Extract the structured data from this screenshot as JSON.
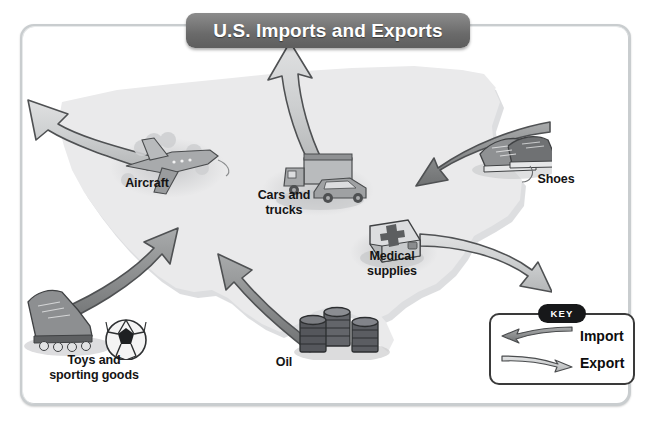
{
  "title": {
    "text": "U.S. Imports and Exports"
  },
  "map": {
    "name": "united-states-map",
    "fill": "#e9e9ea",
    "shadow": "#d6d6d8"
  },
  "colors": {
    "banner": "#6a6a6a",
    "frame_border": "#c9cdcf",
    "import_arrow_dark": "#8e9091",
    "export_arrow_light": "#c7c9ca",
    "arrow_outline": "#4a4c4e",
    "label_text": "#141414",
    "key_border": "#3a3a3a",
    "key_pill": "#17181a",
    "background": "#ffffff"
  },
  "labels": [
    {
      "id": "aircraft",
      "name": "label-aircraft",
      "lines": [
        "Aircraft"
      ],
      "x": 142,
      "y": 176
    },
    {
      "id": "cars",
      "name": "label-cars-and-trucks",
      "lines": [
        "Cars and",
        "trucks"
      ],
      "x": 248,
      "y": 188
    },
    {
      "id": "medical",
      "name": "label-medical-supplies",
      "lines": [
        "Medical",
        "supplies"
      ],
      "x": 363,
      "y": 249
    },
    {
      "id": "shoes",
      "name": "label-shoes",
      "lines": [
        "Shoes"
      ],
      "x": 554,
      "y": 172
    },
    {
      "id": "toys",
      "name": "label-toys",
      "lines": [
        "Toys and",
        "sporting goods"
      ],
      "x": 70,
      "y": 355
    },
    {
      "id": "oil",
      "name": "label-oil",
      "lines": [
        "Oil"
      ],
      "x": 285,
      "y": 355
    }
  ],
  "arrows": [
    {
      "id": "aircraft-export",
      "name": "arrow-aircraft-export",
      "direction": "up-left",
      "type": "Export",
      "shade": "light"
    },
    {
      "id": "cars-export",
      "name": "arrow-cars-export",
      "direction": "up",
      "type": "Export",
      "shade": "light"
    },
    {
      "id": "medical-export",
      "name": "arrow-medical-export",
      "direction": "right",
      "type": "Export",
      "shade": "light"
    },
    {
      "id": "shoes-import",
      "name": "arrow-shoes-import",
      "direction": "left",
      "type": "Import",
      "shade": "dark"
    },
    {
      "id": "toys-import",
      "name": "arrow-toys-import",
      "direction": "up-right",
      "type": "Import",
      "shade": "dark"
    },
    {
      "id": "oil-import",
      "name": "arrow-oil-import",
      "direction": "up-left",
      "type": "Import",
      "shade": "dark"
    }
  ],
  "icons": [
    {
      "id": "aircraft",
      "name": "airplane-icon",
      "semantic": "airplane-with-clouds"
    },
    {
      "id": "cars",
      "name": "truck-and-car-icon",
      "semantic": "truck-and-car"
    },
    {
      "id": "medical",
      "name": "first-aid-kit-icon",
      "semantic": "medical-case-with-cross"
    },
    {
      "id": "shoes",
      "name": "sneakers-icon",
      "semantic": "pair-of-shoes"
    },
    {
      "id": "toys",
      "name": "skate-and-ball-icon",
      "semantic": "inline-skate-and-soccer-ball"
    },
    {
      "id": "oil",
      "name": "oil-barrels-icon",
      "semantic": "three-oil-drums"
    }
  ],
  "key": {
    "heading": "KEY",
    "entries": [
      {
        "label": "Import",
        "name": "key-entry-import",
        "direction": "left",
        "shade": "dark"
      },
      {
        "label": "Export",
        "name": "key-entry-export",
        "direction": "right",
        "shade": "light"
      }
    ]
  }
}
